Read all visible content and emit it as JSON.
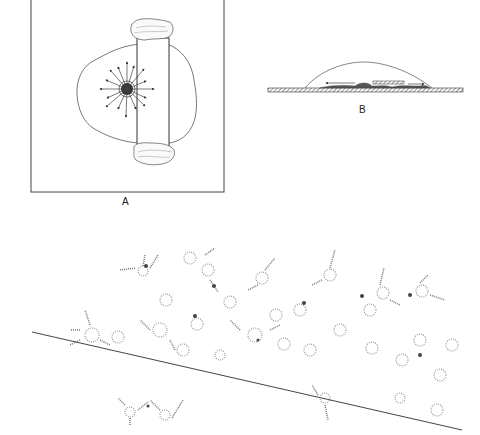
{
  "figure": {
    "panels": [
      {
        "id": "A",
        "label": "A",
        "description": "Top view: cell colony outline with radial arrows from a central dense cluster, a vertical rectangular strip with irregular tissue masses at top and bottom"
      },
      {
        "id": "B",
        "label": "B",
        "description": "Side view: dome over a hatched substrate, with cells migrating along arrows left and right, and a small hatched bar"
      },
      {
        "id": "C",
        "label": "",
        "description": "Stippled network of cells with a diagonal line crossing the field"
      }
    ],
    "colors": {
      "ink": "#333333",
      "stipple": "#888888",
      "background": "#ffffff"
    }
  }
}
